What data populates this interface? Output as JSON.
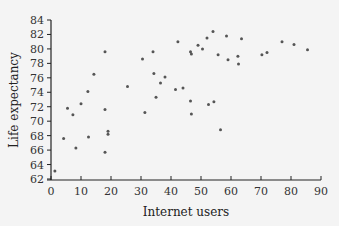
{
  "chart_data": {
    "type": "scatter",
    "title": "",
    "xlabel": "Internet users",
    "ylabel": "Life expectancy",
    "xlim": [
      0,
      90
    ],
    "ylim": [
      62,
      84
    ],
    "xticks": [
      0,
      10,
      20,
      30,
      40,
      50,
      60,
      70,
      80,
      90
    ],
    "yticks": [
      62,
      64,
      66,
      68,
      70,
      72,
      74,
      76,
      78,
      80,
      82,
      84
    ],
    "grid": false,
    "legend": null,
    "colors": {
      "point": "#555555",
      "axis": "#222222",
      "background": "#f4f4f4"
    },
    "points": [
      {
        "x": 1.3,
        "y": 63.1
      },
      {
        "x": 4.2,
        "y": 67.6
      },
      {
        "x": 5.5,
        "y": 71.8
      },
      {
        "x": 7.3,
        "y": 70.9
      },
      {
        "x": 8.3,
        "y": 66.3
      },
      {
        "x": 10.0,
        "y": 72.4
      },
      {
        "x": 12.5,
        "y": 67.8
      },
      {
        "x": 12.3,
        "y": 74.1
      },
      {
        "x": 14.3,
        "y": 76.5
      },
      {
        "x": 18.0,
        "y": 79.6
      },
      {
        "x": 18.0,
        "y": 71.6
      },
      {
        "x": 18.0,
        "y": 65.7
      },
      {
        "x": 19.0,
        "y": 68.6
      },
      {
        "x": 19.0,
        "y": 68.2
      },
      {
        "x": 25.5,
        "y": 74.8
      },
      {
        "x": 30.5,
        "y": 78.6
      },
      {
        "x": 31.3,
        "y": 71.2
      },
      {
        "x": 34.0,
        "y": 79.6
      },
      {
        "x": 34.3,
        "y": 76.6
      },
      {
        "x": 35.0,
        "y": 73.3
      },
      {
        "x": 36.5,
        "y": 75.3
      },
      {
        "x": 38.0,
        "y": 76.1
      },
      {
        "x": 41.5,
        "y": 74.4
      },
      {
        "x": 42.3,
        "y": 81.0
      },
      {
        "x": 44.0,
        "y": 74.6
      },
      {
        "x": 46.5,
        "y": 79.6
      },
      {
        "x": 46.8,
        "y": 79.3
      },
      {
        "x": 46.5,
        "y": 72.8
      },
      {
        "x": 46.8,
        "y": 71.0
      },
      {
        "x": 49.0,
        "y": 80.5
      },
      {
        "x": 50.5,
        "y": 80.0
      },
      {
        "x": 52.0,
        "y": 81.5
      },
      {
        "x": 52.5,
        "y": 72.3
      },
      {
        "x": 54.0,
        "y": 82.4
      },
      {
        "x": 54.3,
        "y": 72.7
      },
      {
        "x": 55.7,
        "y": 79.2
      },
      {
        "x": 56.5,
        "y": 68.8
      },
      {
        "x": 58.5,
        "y": 81.8
      },
      {
        "x": 59.0,
        "y": 78.5
      },
      {
        "x": 62.3,
        "y": 79.0
      },
      {
        "x": 62.5,
        "y": 77.9
      },
      {
        "x": 63.5,
        "y": 81.4
      },
      {
        "x": 70.3,
        "y": 79.2
      },
      {
        "x": 72.0,
        "y": 79.5
      },
      {
        "x": 77.0,
        "y": 81.0
      },
      {
        "x": 81.0,
        "y": 80.6
      },
      {
        "x": 85.5,
        "y": 79.9
      }
    ]
  }
}
